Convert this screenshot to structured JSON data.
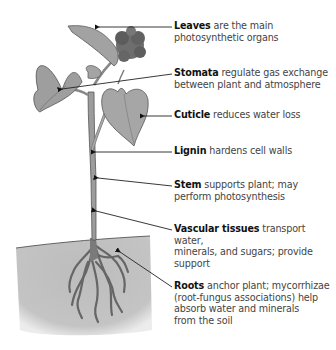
{
  "diagram": {
    "colors": {
      "plant_fill": "#9a9a9a",
      "plant_stroke": "#555555",
      "soil": "#bdbdbd",
      "leader_line": "#222222",
      "term_text": "#111111",
      "desc_text": "#444444"
    },
    "labels": [
      {
        "term": "Leaves",
        "lines": [
          " are the main",
          "photosynthetic organs"
        ]
      },
      {
        "term": "Stomata",
        "lines": [
          " regulate gas exchange",
          "between plant and atmosphere"
        ]
      },
      {
        "term": "Cuticle",
        "lines": [
          " reduces water loss"
        ]
      },
      {
        "term": "Lignin",
        "lines": [
          " hardens cell walls"
        ]
      },
      {
        "term": "Stem",
        "lines": [
          " supports plant; may",
          "perform photosynthesis"
        ]
      },
      {
        "term": "Vascular tissues",
        "lines": [
          " transport water,",
          "minerals, and sugars; provide",
          "support"
        ]
      },
      {
        "term": "Roots",
        "lines": [
          " anchor plant; mycorrhizae",
          "(root-fungus associations) help",
          "absorb water and minerals",
          "from the soil"
        ]
      }
    ]
  }
}
